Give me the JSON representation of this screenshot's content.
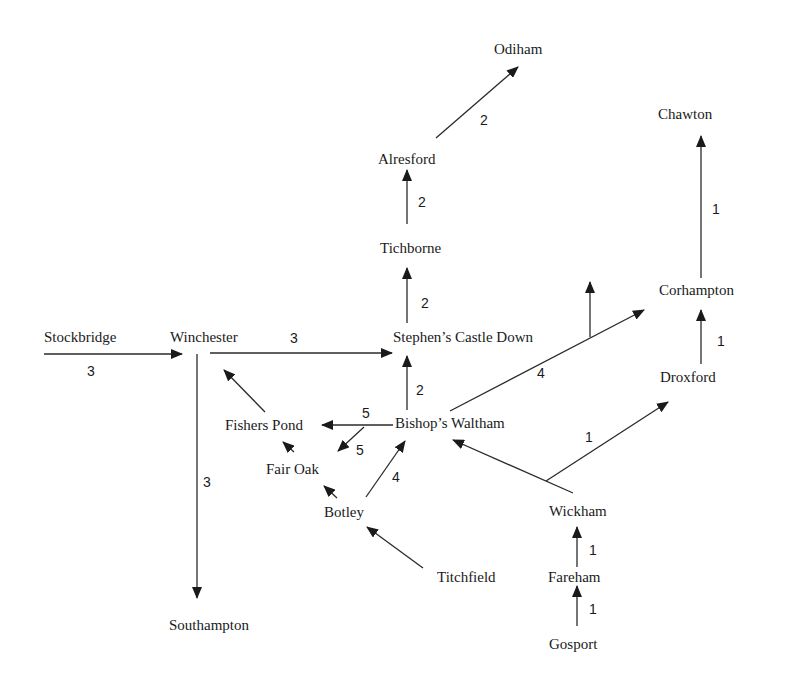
{
  "diagram": {
    "type": "directed-weighted-graph",
    "nodes": [
      {
        "id": "odiham",
        "label": "Odiham"
      },
      {
        "id": "chawton",
        "label": "Chawton"
      },
      {
        "id": "alresford",
        "label": "Alresford"
      },
      {
        "id": "tichborne",
        "label": "Tichborne"
      },
      {
        "id": "corhampton",
        "label": "Corhampton"
      },
      {
        "id": "stockbridge",
        "label": "Stockbridge"
      },
      {
        "id": "winchester",
        "label": "Winchester"
      },
      {
        "id": "stephens_castle_down",
        "label": "Stephen’s Castle Down"
      },
      {
        "id": "droxford",
        "label": "Droxford"
      },
      {
        "id": "fishers_pond",
        "label": "Fishers Pond"
      },
      {
        "id": "bishops_waltham",
        "label": "Bishop’s Waltham"
      },
      {
        "id": "fair_oak",
        "label": "Fair Oak"
      },
      {
        "id": "botley",
        "label": "Botley"
      },
      {
        "id": "wickham",
        "label": "Wickham"
      },
      {
        "id": "fareham",
        "label": "Fareham"
      },
      {
        "id": "titchfield",
        "label": "Titchfield"
      },
      {
        "id": "southampton",
        "label": "Southampton"
      },
      {
        "id": "gosport",
        "label": "Gosport"
      }
    ],
    "edges": [
      {
        "from": "alresford",
        "to": "odiham",
        "weight": "2"
      },
      {
        "from": "tichborne",
        "to": "alresford",
        "weight": "2"
      },
      {
        "from": "stephens_castle_down",
        "to": "tichborne",
        "weight": "2"
      },
      {
        "from": "corhampton",
        "to": "chawton",
        "weight": "1"
      },
      {
        "from": "droxford",
        "to": "corhampton",
        "weight": "1"
      },
      {
        "from": "bishops_waltham",
        "to": "corhampton",
        "weight": "4"
      },
      {
        "from": "stockbridge",
        "to": "winchester",
        "weight": "3"
      },
      {
        "from": "winchester",
        "to": "stephens_castle_down",
        "weight": "3"
      },
      {
        "from": "winchester",
        "to": "southampton",
        "weight": "3"
      },
      {
        "from": "bishops_waltham",
        "to": "stephens_castle_down",
        "weight": "2"
      },
      {
        "from": "bishops_waltham",
        "to": "fishers_pond",
        "weight": "5"
      },
      {
        "from": "bishops_waltham",
        "to": "fair_oak",
        "weight": "5"
      },
      {
        "from": "botley",
        "to": "bishops_waltham",
        "weight": "4"
      },
      {
        "from": "wickham",
        "to": "droxford",
        "weight": "1"
      },
      {
        "from": "fareham",
        "to": "wickham",
        "weight": "1"
      },
      {
        "from": "gosport",
        "to": "fareham",
        "weight": "1"
      },
      {
        "from": "fishers_pond",
        "to": "winchester",
        "weight": ""
      },
      {
        "from": "fair_oak",
        "to": "fishers_pond",
        "weight": ""
      },
      {
        "from": "botley",
        "to": "fair_oak",
        "weight": ""
      },
      {
        "from": "titchfield",
        "to": "botley",
        "weight": ""
      },
      {
        "from": "wickham",
        "to": "bishops_waltham",
        "weight": ""
      },
      {
        "from": "4-edge-branch",
        "to": "up",
        "weight": ""
      }
    ],
    "weights": {
      "alresford_odiham": "2",
      "tichborne_alresford": "2",
      "scd_tichborne": "2",
      "corhampton_chawton": "1",
      "droxford_corhampton": "1",
      "bw_corhampton": "4",
      "stockbridge_winchester": "3",
      "winchester_scd": "3",
      "winchester_southampton": "3",
      "bw_scd": "2",
      "bw_fishers_pond": "5",
      "bw_fair_oak": "5",
      "botley_bw": "4",
      "wickham_droxford": "1",
      "fareham_wickham": "1",
      "gosport_fareham": "1"
    },
    "labels": {
      "odiham": "Odiham",
      "chawton": "Chawton",
      "alresford": "Alresford",
      "tichborne": "Tichborne",
      "corhampton": "Corhampton",
      "stockbridge": "Stockbridge",
      "winchester": "Winchester",
      "stephens_castle_down": "Stephen’s Castle Down",
      "droxford": "Droxford",
      "fishers_pond": "Fishers Pond",
      "bishops_waltham": "Bishop’s Waltham",
      "fair_oak": "Fair Oak",
      "botley": "Botley",
      "wickham": "Wickham",
      "fareham": "Fareham",
      "titchfield": "Titchfield",
      "southampton": "Southampton",
      "gosport": "Gosport"
    },
    "colors": {
      "line": "#2a2a2a",
      "text": "#1a1a1a",
      "background": "#ffffff"
    }
  }
}
